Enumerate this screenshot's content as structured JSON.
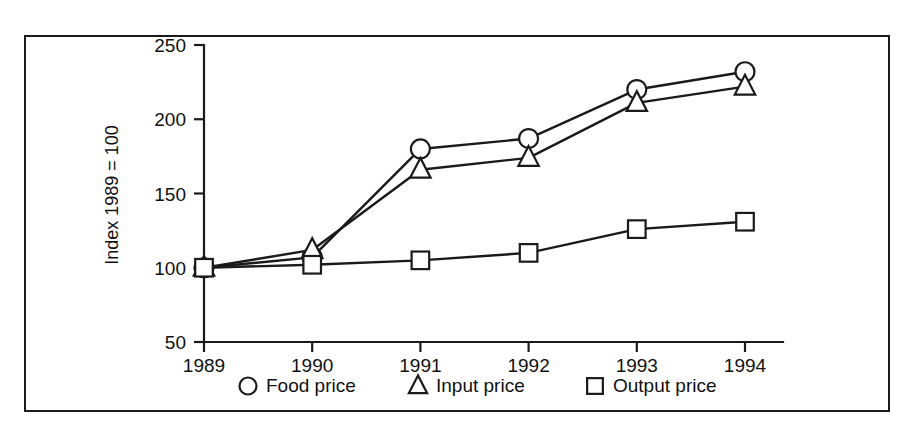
{
  "chart_data": {
    "type": "line",
    "title": "",
    "xlabel": "",
    "ylabel": "Index 1989 = 100",
    "categories": [
      "1989",
      "1990",
      "1991",
      "1992",
      "1993",
      "1994"
    ],
    "x": [
      1989,
      1990,
      1991,
      1992,
      1993,
      1994
    ],
    "xlim": [
      1989,
      1994
    ],
    "ylim": [
      50,
      250
    ],
    "yticks": [
      50,
      100,
      150,
      200,
      250
    ],
    "ytick_labels": [
      "50",
      "100",
      "150",
      "200",
      "250"
    ],
    "xtick_labels": [
      "1989",
      "1990",
      "1991",
      "1992",
      "1993",
      "1994"
    ],
    "grid": false,
    "legend_position": "bottom",
    "series": [
      {
        "name": "Food price",
        "marker": "circle",
        "values": [
          100,
          107,
          180,
          187,
          220,
          232
        ]
      },
      {
        "name": "Input price",
        "marker": "triangle",
        "values": [
          100,
          112,
          166,
          174,
          211,
          222
        ]
      },
      {
        "name": "Output price",
        "marker": "square",
        "values": [
          100,
          102,
          105,
          110,
          126,
          131
        ]
      }
    ]
  },
  "legend": {
    "items": [
      {
        "label": "Food price",
        "marker": "circle"
      },
      {
        "label": "Input price",
        "marker": "triangle"
      },
      {
        "label": "Output price",
        "marker": "square"
      }
    ]
  },
  "axes": {
    "y_title": "Index 1989 = 100"
  }
}
